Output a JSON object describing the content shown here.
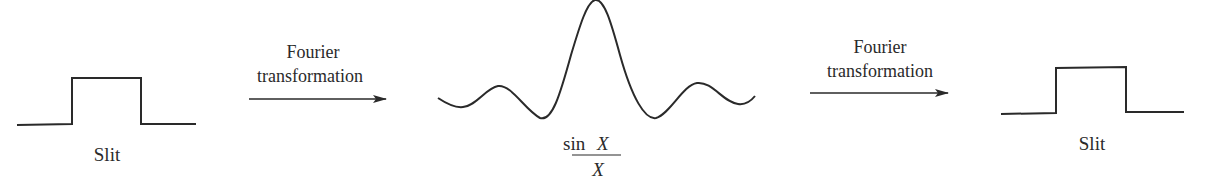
{
  "diagram": {
    "stages": [
      {
        "id": "slit-left",
        "label": "Slit"
      },
      {
        "id": "sinc",
        "label_numerator_fn": "sin",
        "label_numerator_var": "X",
        "label_denominator": "X"
      },
      {
        "id": "slit-right",
        "label": "Slit"
      }
    ],
    "arrows": [
      {
        "line1": "Fourier",
        "line2": "transformation"
      },
      {
        "line1": "Fourier",
        "line2": "transformation"
      }
    ],
    "colors": {
      "stroke": "#2a2a2a",
      "background": "#ffffff"
    }
  }
}
